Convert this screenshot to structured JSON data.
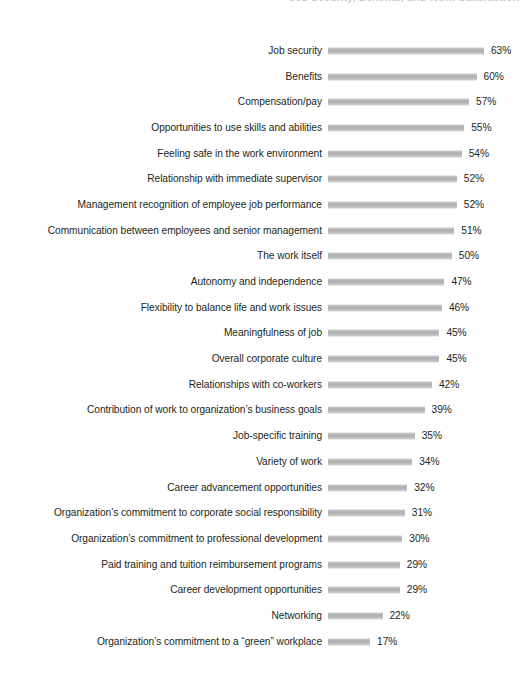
{
  "chart_data": {
    "type": "bar",
    "orientation": "horizontal",
    "title": "Job Security, Benefits, and Work Satisfaction",
    "xlabel": "",
    "ylabel": "",
    "grid": false,
    "legend": "none",
    "value_suffix": "%",
    "xlim": [
      0,
      63
    ],
    "categories": [
      "Job security",
      "Benefits",
      "Compensation/pay",
      "Opportunities to use skills and abilities",
      "Feeling safe in the work environment",
      "Relationship with immediate supervisor",
      "Management recognition of employee job performance",
      "Communication between employees and senior management",
      "The work itself",
      "Autonomy and independence",
      "Flexibility to balance life and work issues",
      "Meaningfulness of job",
      "Overall corporate culture",
      "Relationships with co-workers",
      "Contribution of work to organization’s business goals",
      "Job-specific training",
      "Variety of work",
      "Career advancement opportunities",
      "Organization’s commitment to corporate social responsibility",
      "Organization’s commitment to professional development",
      "Paid training and tuition reimbursement programs",
      "Career development opportunities",
      "Networking",
      "Organization’s commitment to a “green” workplace"
    ],
    "values": [
      63,
      60,
      57,
      55,
      54,
      52,
      52,
      51,
      50,
      47,
      46,
      45,
      45,
      42,
      39,
      35,
      34,
      32,
      31,
      30,
      29,
      29,
      22,
      17
    ],
    "value_labels": [
      "63%",
      "60%",
      "57%",
      "55%",
      "54%",
      "52%",
      "52%",
      "51%",
      "50%",
      "47%",
      "46%",
      "45%",
      "45%",
      "42%",
      "39%",
      "35%",
      "34%",
      "32%",
      "31%",
      "30%",
      "29%",
      "29%",
      "22%",
      "17%"
    ],
    "bar_color": "#b5b5b5",
    "text_color": "#231f20"
  }
}
